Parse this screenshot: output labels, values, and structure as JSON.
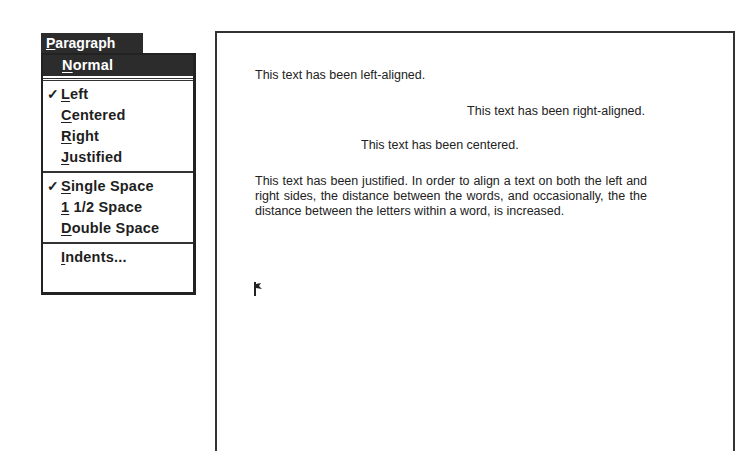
{
  "menu": {
    "title": "Paragraph",
    "title_mnemonic": "P",
    "items": [
      {
        "label": "Normal",
        "mnemonic_index": 0,
        "checked": false,
        "highlighted": true
      },
      {
        "label": "Left",
        "mnemonic_index": 0,
        "checked": true
      },
      {
        "label": "Centered",
        "mnemonic_index": 0,
        "checked": false
      },
      {
        "label": "Right",
        "mnemonic_index": 0,
        "checked": false
      },
      {
        "label": "Justified",
        "mnemonic_index": 0,
        "checked": false
      },
      {
        "label": "Single Space",
        "mnemonic_index": 0,
        "checked": true
      },
      {
        "label": "1 1/2 Space",
        "mnemonic_index": 0,
        "checked": false
      },
      {
        "label": "Double Space",
        "mnemonic_index": 0,
        "checked": false
      },
      {
        "label": "Indents...",
        "mnemonic_index": 0,
        "checked": false
      }
    ],
    "check_glyph": "✓"
  },
  "document": {
    "left_aligned": "This text has been left-aligned.",
    "right_aligned": "This text has been right-aligned.",
    "centered": "This text has been centered.",
    "justified": "This text has been justified. In order to align a text on both the left and right sides, the distance between the words, and occasionally, the the distance between the letters within a word, is increased."
  }
}
